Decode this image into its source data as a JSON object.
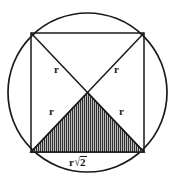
{
  "figure": {
    "type": "geometry-diagram",
    "canvas": {
      "width": 170,
      "height": 187,
      "background": "#ffffff"
    },
    "stroke_color": "#1a1a1a",
    "shading": {
      "pattern": "vertical-hatch",
      "line_color": "#2b2b2b",
      "fill_color": "#b9b9b9",
      "spacing_px": 2
    },
    "circle": {
      "cx": 87.5,
      "cy": 92.5,
      "r": 79.5
    },
    "square": {
      "top_left": {
        "x": 31,
        "y": 33
      },
      "top_right": {
        "x": 144,
        "y": 33
      },
      "bottom_right": {
        "x": 144,
        "y": 152
      },
      "bottom_left": {
        "x": 31,
        "y": 152
      }
    },
    "center": {
      "x": 87.5,
      "y": 92.5
    },
    "shaded_triangle": {
      "vertices": [
        {
          "x": 31,
          "y": 152
        },
        {
          "x": 144,
          "y": 152
        },
        {
          "x": 87.5,
          "y": 92.5
        }
      ]
    },
    "labels": [
      {
        "id": "r-upper-left",
        "text": "r",
        "x": 54,
        "y": 64
      },
      {
        "id": "r-upper-right",
        "text": "r",
        "x": 114,
        "y": 64
      },
      {
        "id": "r-lower-left",
        "text": "r",
        "x": 49,
        "y": 106
      },
      {
        "id": "r-lower-right",
        "text": "r",
        "x": 119,
        "y": 106
      }
    ],
    "hypotenuse_label": {
      "id": "r-sqrt-2",
      "prefix": "r",
      "radical": "√",
      "radicand": "2",
      "x": 69,
      "y": 156
    }
  }
}
